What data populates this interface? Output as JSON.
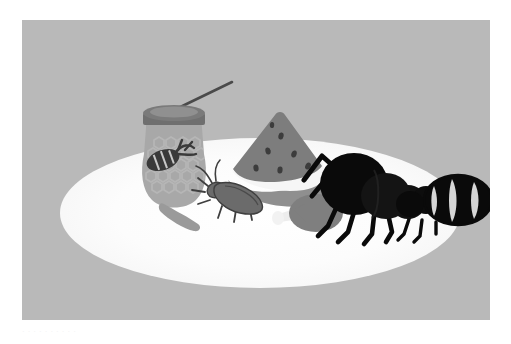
{
  "scene": {
    "title": "Ants approaching picnic food on a white tablecloth",
    "background_color": "#b9b9b9",
    "page_color": "#ffffff",
    "surface_color": "#fdfdfd",
    "caption": "· · ·   · ·   · ·   · ·   ·"
  },
  "palette": {
    "background": "#b9b9b9",
    "tablecloth_white": "#fdfdfd",
    "jar_glass": "#a8a8a8",
    "jar_lid": "#6f6f6f",
    "jar_honeycomb": "#b4b4b4",
    "bee_body": "#3a3a3a",
    "dipper_handle": "#4a4a4a",
    "dipper_drop": "#f0f0f0",
    "melon_flesh": "#7d7d7d",
    "melon_rind_white": "#f6f6f6",
    "melon_rind_green": "#8f8f8f",
    "melon_seed": "#3c3c3c",
    "roach_body": "#6b6b6b",
    "roach_outline": "#3f3f3f",
    "crumb": "#9a9a9a",
    "lollipop_candy": "#7f7f7f",
    "lollipop_stick": "#ededed",
    "ant_black": "#0a0a0a",
    "ant_dark": "#161616",
    "ant_highlight": "#e8e8e8"
  },
  "objects": [
    {
      "id": "honey-jar",
      "label": "Honey jar",
      "description": "Rounded glass jar with a dark lid, honeycomb texture and a bee emblem",
      "position": {
        "x": 110,
        "y": 100,
        "width": 95,
        "height": 110
      }
    },
    {
      "id": "honey-dipper",
      "label": "Honey dipper",
      "description": "Thin angled dipper stick with a light honey drop resting on the jar lid",
      "position": {
        "x": 160,
        "y": 78,
        "width": 72,
        "height": 32
      }
    },
    {
      "id": "watermelon-slice",
      "label": "Watermelon slice",
      "description": "Triangular slice with seeds, white inner rind and darker outer rind",
      "position": {
        "x": 212,
        "y": 100,
        "width": 90,
        "height": 70
      }
    },
    {
      "id": "cockroach",
      "label": "Cockroach",
      "description": "Small beetle-like insect with antennae and legs walking on the cloth",
      "position": {
        "x": 192,
        "y": 172,
        "width": 70,
        "height": 50
      }
    },
    {
      "id": "food-crumb",
      "label": "Food crumb",
      "description": "Elongated grey crumb lying on the cloth",
      "position": {
        "x": 160,
        "y": 205,
        "width": 46,
        "height": 18
      }
    },
    {
      "id": "lollipop",
      "label": "Lollipop",
      "description": "Oval candy head with a short pale stick pointing left",
      "position": {
        "x": 258,
        "y": 186,
        "width": 64,
        "height": 44
      }
    },
    {
      "id": "ant-foreground",
      "label": "Large ant",
      "description": "Black silhouetted ant with raised antennae, six legs and segmented body",
      "position": {
        "x": 300,
        "y": 128,
        "width": 120,
        "height": 110
      }
    },
    {
      "id": "ant-background",
      "label": "Striped ant",
      "description": "Second ant with a large striped abdomen behind the first ant",
      "position": {
        "x": 390,
        "y": 145,
        "width": 80,
        "height": 90
      }
    },
    {
      "id": "tablecloth",
      "label": "White tablecloth",
      "description": "Large white ellipse forming the picnic surface under the food",
      "position": {
        "x": 80,
        "y": 140,
        "width": 320,
        "height": 110
      }
    }
  ]
}
